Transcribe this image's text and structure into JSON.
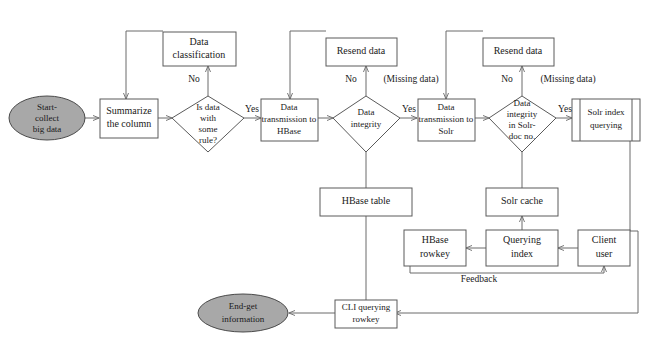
{
  "figure": {
    "type": "flowchart",
    "title": "",
    "width": 653,
    "height": 344,
    "colors": {
      "background": "#ffffff",
      "stroke": "#5a5a5a",
      "edge": "#6a6a6a",
      "node_fill": "#ffffff",
      "terminal_fill": "#a8a8a8",
      "text": "#1a1a1a"
    }
  },
  "nodes": {
    "start": {
      "label_line1": "Start-",
      "label_line2": "collect",
      "label_line3": "big data",
      "shape": "ellipse"
    },
    "summarize": {
      "label_line1": "Summarize",
      "label_line2": "the column",
      "shape": "process"
    },
    "is_data_rule": {
      "label_line1": "Is data",
      "label_line2": "with",
      "label_line3": "some",
      "label_line4": "rule?",
      "shape": "decision"
    },
    "data_classification": {
      "label_line1": "Data",
      "label_line2": "classification",
      "shape": "process"
    },
    "transmission_hbase": {
      "label_line1": "Data",
      "label_line2": "transmission to",
      "label_line3": "HBase",
      "shape": "process"
    },
    "data_integrity": {
      "label_line1": "Data",
      "label_line2": "integrity",
      "shape": "decision"
    },
    "resend_data_1": {
      "label_line1": "Resend data",
      "shape": "process"
    },
    "transmission_solr": {
      "label_line1": "Data",
      "label_line2": "transmission to",
      "label_line3": "Solr",
      "shape": "process"
    },
    "integrity_solr_doc": {
      "label_line1": "Data",
      "label_line2": "integrity",
      "label_line3": "in Solr-",
      "label_line4": "doc no.",
      "shape": "decision"
    },
    "resend_data_2": {
      "label_line1": "Resend data",
      "shape": "process"
    },
    "solr_index_querying": {
      "label_line1": "Solr index",
      "label_line2": "querying",
      "shape": "predefined-process"
    },
    "hbase_table": {
      "label_line1": "HBase table",
      "shape": "process"
    },
    "solr_cache": {
      "label_line1": "Solr cache",
      "shape": "process"
    },
    "hbase_rowkey": {
      "label_line1": "HBase",
      "label_line2": "rowkey",
      "shape": "process"
    },
    "querying_index": {
      "label_line1": "Querying",
      "label_line2": "index",
      "shape": "process"
    },
    "client_user": {
      "label_line1": "Client",
      "label_line2": "user",
      "shape": "process"
    },
    "cli_querying_rowkey": {
      "label_line1": "CLI querying",
      "label_line2": "rowkey",
      "shape": "process"
    },
    "end": {
      "label_line1": "End-get",
      "label_line2": "information",
      "shape": "ellipse"
    }
  },
  "edge_labels": {
    "no_1": "No",
    "yes_1": "Yes",
    "no_2": "No",
    "missing_data_1": "(Missing data)",
    "yes_2": "Yes",
    "no_3": "No",
    "missing_data_2": "(Missing data)",
    "yes_3": "Yes",
    "feedback": "Feedback"
  }
}
